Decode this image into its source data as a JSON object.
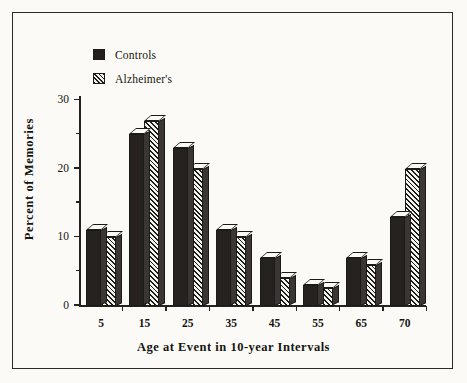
{
  "chart_data": {
    "type": "bar",
    "title": "",
    "xlabel": "Age at Event in 10-year Intervals",
    "ylabel": "Percent of Memories",
    "categories": [
      "5",
      "15",
      "25",
      "35",
      "45",
      "55",
      "65",
      "70"
    ],
    "series": [
      {
        "name": "Controls",
        "values": [
          11,
          25,
          23,
          11,
          7,
          3,
          7,
          13
        ],
        "fill": "solid",
        "color": "#262220"
      },
      {
        "name": "Alzheimer's",
        "values": [
          10,
          27,
          20,
          10,
          4,
          2.5,
          6,
          20
        ],
        "fill": "hatch",
        "color": "#f4f2ed"
      }
    ],
    "ylim": [
      0,
      30
    ],
    "yticks": [
      0,
      10,
      20,
      30
    ],
    "yticks_minor": [
      5,
      15,
      25
    ],
    "grid": false,
    "legend_position": "top-left",
    "style": "3d-bars"
  },
  "legend": {
    "items": [
      {
        "label": "Controls",
        "swatch": "solid-square-icon"
      },
      {
        "label": "Alzheimer's",
        "swatch": "hatched-square-icon"
      }
    ]
  },
  "axes": {
    "y_tick_labels": [
      "0",
      "10",
      "20",
      "30"
    ],
    "x_tick_labels": [
      "5",
      "15",
      "25",
      "35",
      "45",
      "55",
      "65",
      "70"
    ]
  }
}
